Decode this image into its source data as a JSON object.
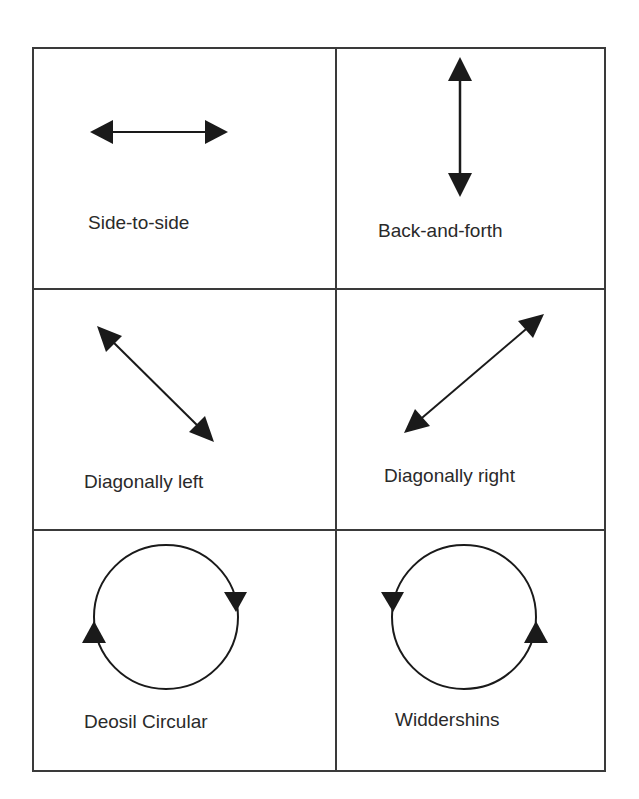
{
  "diagram": {
    "title": "",
    "grid": {
      "rows": 3,
      "cols": 2,
      "border_color": "#3a3a3a"
    },
    "colors": {
      "arrow": "#1a1a1a",
      "text": "#2a2a2a",
      "background": "#ffffff"
    },
    "cells": [
      {
        "label": "Side-to-side",
        "icon": "horizontal-double-arrow-icon",
        "motion": "side-to-side"
      },
      {
        "label": "Back-and-forth",
        "icon": "vertical-double-arrow-icon",
        "motion": "back-and-forth"
      },
      {
        "label": "Diagonally left",
        "icon": "diagonal-left-double-arrow-icon",
        "motion": "diagonal-left"
      },
      {
        "label": "Diagonally right",
        "icon": "diagonal-right-double-arrow-icon",
        "motion": "diagonal-right"
      },
      {
        "label": "Deosil Circular",
        "icon": "clockwise-circle-icon",
        "motion": "clockwise"
      },
      {
        "label": "Widdershins",
        "icon": "counterclockwise-circle-icon",
        "motion": "counterclockwise"
      }
    ]
  }
}
